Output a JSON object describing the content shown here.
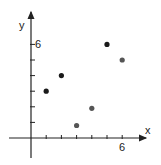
{
  "chart_data": {
    "type": "scatter",
    "title": "",
    "xlabel": "x",
    "ylabel": "y",
    "x_tick_label": "6",
    "y_tick_label": "6",
    "xlim": [
      0,
      6
    ],
    "ylim": [
      0,
      6
    ],
    "grid": false,
    "legend": null,
    "points": [
      {
        "x": 1,
        "y": 3,
        "color": "#1a1a1a"
      },
      {
        "x": 2,
        "y": 4,
        "color": "#1a1a1a"
      },
      {
        "x": 3,
        "y": 0.8,
        "color": "#555555"
      },
      {
        "x": 4,
        "y": 1.9,
        "color": "#555555"
      },
      {
        "x": 5,
        "y": 6,
        "color": "#1a1a1a"
      },
      {
        "x": 6,
        "y": 5,
        "color": "#555555"
      }
    ]
  }
}
